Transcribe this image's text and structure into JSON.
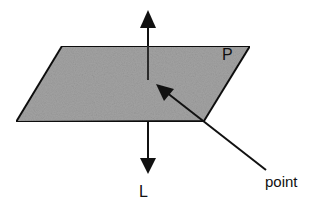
{
  "diagram": {
    "plane": {
      "label": "P",
      "fill_color": "#a3a3a3",
      "stroke_color": "#111111",
      "vertices": [
        [
          62,
          46
        ],
        [
          250,
          46
        ],
        [
          204,
          121
        ],
        [
          16,
          122
        ]
      ]
    },
    "line": {
      "label": "L",
      "color": "#111111",
      "x": 148,
      "top_arrow_tip_y": 10,
      "bottom_arrow_tip_y": 174
    },
    "point_callout": {
      "label": "point",
      "arrow_tip": [
        156,
        84
      ],
      "line_end": [
        266,
        170
      ],
      "color": "#111111"
    }
  }
}
